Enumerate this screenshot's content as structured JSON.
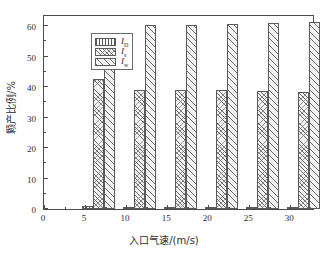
{
  "chart_data": {
    "type": "bar",
    "title": "",
    "xlabel": "入口气速/(m/s)",
    "ylabel": "颗产比例/%",
    "categories": [
      5,
      10,
      15,
      20,
      25,
      30
    ],
    "xtick_labels": [
      "0",
      "5",
      "10",
      "15",
      "20",
      "25",
      "30"
    ],
    "xticks": [
      0,
      5,
      10,
      15,
      20,
      25,
      30
    ],
    "ytick_labels": [
      "0",
      "10",
      "20",
      "30",
      "40",
      "50",
      "60"
    ],
    "yticks": [
      0,
      10,
      20,
      30,
      40,
      50,
      60
    ],
    "xlim": [
      0,
      33
    ],
    "ylim": [
      0,
      64
    ],
    "grid": false,
    "legend_position": "upper-left",
    "series": [
      {
        "name": "I_D",
        "label_base": "I",
        "label_sub": "D",
        "pattern": "vertical-lines",
        "values": [
          0.9,
          0.6,
          0.5,
          0.4,
          0.4,
          0.3
        ]
      },
      {
        "name": "I_s",
        "label_base": "I",
        "label_sub": "s",
        "pattern": "fine-cross-hatch",
        "values": [
          42.7,
          39.1,
          39.1,
          39.1,
          38.8,
          38.5
        ]
      },
      {
        "name": "I_w",
        "label_base": "I",
        "label_sub": "w",
        "pattern": "diagonal-hatch",
        "values": [
          56.3,
          60.4,
          60.4,
          60.6,
          61.0,
          61.3
        ]
      }
    ]
  },
  "axis": {
    "x_title": "入口气速/(m/s)",
    "y_title": "颗产比例/%"
  }
}
